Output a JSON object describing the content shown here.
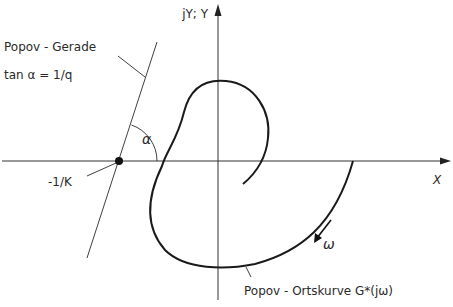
{
  "diagram": {
    "type": "popov-criterion-plot",
    "axes": {
      "x_label": "X",
      "y_label": "jY; Y"
    },
    "popov_line": {
      "label_line1": "Popov - Gerade",
      "label_line2": "tan α = 1/q",
      "intersection_label": "-1/K",
      "angle_label": "α"
    },
    "locus": {
      "label": "Popov - Ortskurve G*(jω)",
      "direction_label": "ω"
    }
  }
}
